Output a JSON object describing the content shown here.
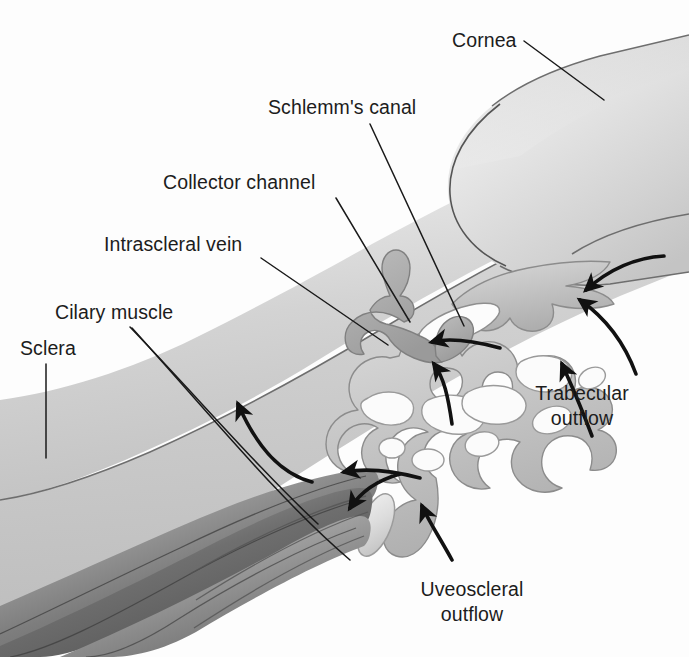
{
  "figure": {
    "background_color": "#fdfdfd",
    "text_color": "#1c1c1c"
  },
  "labels": [
    {
      "id": "cornea",
      "text": "Cornea",
      "x": 452,
      "y": 47,
      "anchor": "start"
    },
    {
      "id": "schlemms-canal",
      "text": "Schlemm's canal",
      "x": 268,
      "y": 114,
      "anchor": "start"
    },
    {
      "id": "collector-channel",
      "text": "Collector channel",
      "x": 163,
      "y": 189,
      "anchor": "start"
    },
    {
      "id": "intrascleral-vein",
      "text": "Intrascleral vein",
      "x": 104,
      "y": 251,
      "anchor": "start"
    },
    {
      "id": "cilary-muscle",
      "text": "Cilary muscle",
      "x": 55,
      "y": 319,
      "anchor": "start"
    },
    {
      "id": "sclera",
      "text": "Sclera",
      "x": 20,
      "y": 355,
      "anchor": "start"
    }
  ],
  "flow_labels": [
    {
      "id": "trabecular-outflow",
      "line1": "Trabecular",
      "line2": "outflow",
      "x": 582,
      "y1": 400,
      "y2": 425
    },
    {
      "id": "uveoscleral-outflow",
      "line1": "Uveoscleral",
      "line2": "outflow",
      "x": 472,
      "y1": 596,
      "y2": 621
    }
  ],
  "structures": [
    {
      "id": "sclera-band",
      "name": "Sclera",
      "tone": "light-grey-gradient"
    },
    {
      "id": "cornea-wedge",
      "name": "Cornea",
      "tone": "light-grey-gradient"
    },
    {
      "id": "trabecular-meshwork",
      "name": "Trabecular meshwork",
      "tone": "mid-grey-blob"
    },
    {
      "id": "schlemms-canal-lumen",
      "name": "Schlemm's canal lumen",
      "tone": "white-oval"
    },
    {
      "id": "collector-channel-duct",
      "name": "Collector channel",
      "tone": "mid-grey"
    },
    {
      "id": "intrascleral-vein-branch",
      "name": "Intrascleral vein",
      "tone": "mid-grey"
    },
    {
      "id": "ciliary-muscle-fibers",
      "name": "Ciliary muscle bundles",
      "tone": "dark-grey-fibers"
    },
    {
      "id": "scleral-spur",
      "name": "Scleral spur / iris root oval",
      "tone": "light-grey-oval"
    }
  ],
  "flow_arrows": [
    {
      "id": "trabecular-arrow-1",
      "direction": "leftward-into-meshwork"
    },
    {
      "id": "trabecular-arrow-2",
      "direction": "leftward-into-meshwork"
    },
    {
      "id": "trabecular-arrow-3",
      "direction": "upward-into-meshwork"
    },
    {
      "id": "canal-arrow-1",
      "direction": "leftward-into-canal"
    },
    {
      "id": "canal-arrow-2",
      "direction": "leftward-into-canal"
    },
    {
      "id": "uveoscleral-arrow-1",
      "direction": "leftward-into-ciliary-muscle"
    },
    {
      "id": "uveoscleral-arrow-2",
      "direction": "down-left-along-spur"
    },
    {
      "id": "uveoscleral-arrow-3",
      "direction": "upward-into-angle"
    },
    {
      "id": "sclera-arrow",
      "direction": "upward-through-sclera"
    }
  ],
  "colors": {
    "tissue_light": "#e0e0e0",
    "tissue_mid": "#b9b9b9",
    "tissue_dark": "#6d6d6d",
    "muscle_dark": "#5a5a5a",
    "outline": "#6e6e6e",
    "arrow": "#111111",
    "leader": "#1a1a1a"
  }
}
